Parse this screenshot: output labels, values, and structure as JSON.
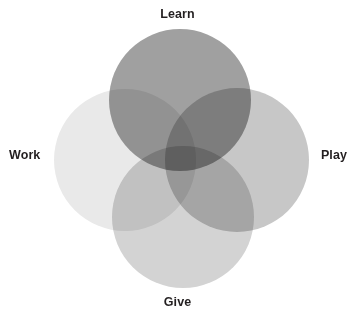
{
  "figure": {
    "type": "venn-diagram",
    "background_color": "#ffffff",
    "label_color": "#231f20",
    "blend_mode": "multiply"
  },
  "chart_data": {
    "type": "venn",
    "title": "",
    "subtitle": "",
    "xlabel": "",
    "ylabel": "",
    "set_count": 4,
    "layout": "four-circle-rosette",
    "legend_position": "outside-each-circle",
    "grid": false,
    "sets": [
      {
        "id": "learn",
        "label": "Learn",
        "label_position": "top",
        "fill": "#a0a0a0",
        "cx": 180,
        "cy": 100,
        "r": 71
      },
      {
        "id": "work",
        "label": "Work",
        "label_position": "left",
        "fill": "#e9e9e9",
        "cx": 125,
        "cy": 160,
        "r": 71
      },
      {
        "id": "play",
        "label": "Play",
        "label_position": "right",
        "fill": "#c7c7c7",
        "cx": 237,
        "cy": 160,
        "r": 72
      },
      {
        "id": "give",
        "label": "Give",
        "label_position": "bottom",
        "fill": "#d3d3d3",
        "cx": 183,
        "cy": 217,
        "r": 71
      }
    ],
    "overlap_note": "Overlapping regions darken via multiply blending; the Learn-Play intersection is the darkest area."
  },
  "labels": {
    "learn": "Learn",
    "work": "Work",
    "play": "Play",
    "give": "Give"
  }
}
